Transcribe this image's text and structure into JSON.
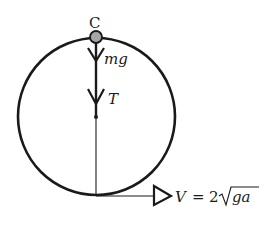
{
  "diagram": {
    "type": "vertical circular motion",
    "point_label": "C",
    "forces": [
      {
        "name": "weight",
        "label": "mg",
        "direction": "down"
      },
      {
        "name": "tension",
        "label": "T",
        "direction": "down"
      }
    ],
    "velocity": {
      "label_lhs": "V",
      "label_eq": "=",
      "label_coef": "2",
      "label_radicand": "ga",
      "direction": "right"
    },
    "colors": {
      "stroke": "#1a1a1a",
      "ball_fill": "#a6a6a6",
      "background": "#ffffff"
    }
  }
}
